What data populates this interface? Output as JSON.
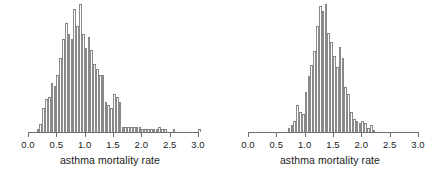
{
  "figure": {
    "panel_count": 2,
    "background_color": "#ffffff",
    "bar_fill_color": "#ffffff",
    "bar_outline_color": "#8a8a8a",
    "axis_color": "#6e6e6e",
    "text_color": "#1a1a1a"
  },
  "chart_data": [
    {
      "type": "bar",
      "subtype": "histogram",
      "panel": "left",
      "title": "",
      "xlabel": "asthma mortality rate",
      "ylabel": "",
      "xlim": [
        0.0,
        3.0
      ],
      "ylim": [
        0,
        50
      ],
      "grid": false,
      "legend": "none",
      "bin_width": 0.05,
      "tick_labels": [
        "0.0",
        "0.5",
        "1.0",
        "1.5",
        "2.0",
        "2.5",
        "3.0"
      ],
      "tick_values": [
        0.0,
        0.5,
        1.0,
        1.5,
        2.0,
        2.5,
        3.0
      ],
      "bin_starts": [
        0.15,
        0.2,
        0.25,
        0.3,
        0.35,
        0.4,
        0.45,
        0.5,
        0.55,
        0.6,
        0.65,
        0.7,
        0.75,
        0.8,
        0.85,
        0.9,
        0.95,
        1.0,
        1.05,
        1.1,
        1.15,
        1.2,
        1.25,
        1.3,
        1.35,
        1.4,
        1.45,
        1.5,
        1.55,
        1.6,
        1.65,
        1.7,
        1.75,
        1.8,
        1.85,
        1.9,
        1.95,
        2.0,
        2.05,
        2.1,
        2.15,
        2.2,
        2.25,
        2.3,
        2.35,
        2.4,
        2.45,
        2.5,
        2.55,
        2.6,
        2.65,
        2.7,
        2.75,
        2.8,
        2.85,
        2.9,
        2.95,
        3.0
      ],
      "values": [
        1,
        3,
        9,
        12,
        13,
        18,
        17,
        21,
        27,
        34,
        40,
        36,
        34,
        45,
        39,
        47,
        36,
        31,
        35,
        30,
        25,
        23,
        21,
        21,
        11,
        10,
        9,
        14,
        13,
        11,
        2,
        2,
        2,
        2,
        2,
        2,
        2,
        1,
        1,
        1,
        1,
        1,
        1,
        2,
        1,
        1,
        0,
        0,
        1,
        0,
        0,
        0,
        0,
        0,
        0,
        0,
        0,
        1
      ],
      "peak_bin": 0.9,
      "peak_value": 47
    },
    {
      "type": "bar",
      "subtype": "histogram",
      "panel": "right",
      "title": "",
      "xlabel": "asthma mortality rate",
      "ylabel": "",
      "xlim": [
        0.0,
        3.0
      ],
      "ylim": [
        0,
        60
      ],
      "grid": false,
      "legend": "none",
      "bin_width": 0.05,
      "tick_labels": [
        "0.0",
        "0.5",
        "1.0",
        "1.5",
        "2.0",
        "2.5",
        "3.0"
      ],
      "tick_values": [
        0.0,
        0.5,
        1.0,
        1.5,
        2.0,
        2.5,
        3.0
      ],
      "bin_starts": [
        0.7,
        0.75,
        0.8,
        0.85,
        0.9,
        0.95,
        1.0,
        1.05,
        1.1,
        1.15,
        1.2,
        1.25,
        1.3,
        1.35,
        1.4,
        1.45,
        1.5,
        1.55,
        1.6,
        1.65,
        1.7,
        1.75,
        1.8,
        1.85,
        1.9,
        1.95,
        2.0,
        2.05,
        2.1,
        2.15,
        2.2
      ],
      "values": [
        2,
        3,
        5,
        12,
        9,
        8,
        18,
        25,
        30,
        36,
        47,
        56,
        54,
        57,
        44,
        40,
        34,
        29,
        38,
        33,
        20,
        17,
        9,
        6,
        5,
        4,
        5,
        4,
        2,
        3,
        1
      ],
      "peak_bin": 1.35,
      "peak_value": 57
    }
  ],
  "panels": [
    {
      "name": "left-histogram",
      "xlabel": "asthma mortality rate",
      "ticks": [
        "0.0",
        "0.5",
        "1.0",
        "1.5",
        "2.0",
        "2.5",
        "3.0"
      ]
    },
    {
      "name": "right-histogram",
      "xlabel": "asthma mortality rate",
      "ticks": [
        "0.0",
        "0.5",
        "1.0",
        "1.5",
        "2.0",
        "2.5",
        "3.0"
      ]
    }
  ]
}
